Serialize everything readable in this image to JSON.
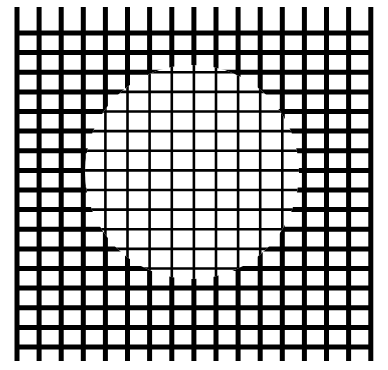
{
  "figure": {
    "kind": "illusory-contour-grid",
    "canvas": {
      "width": 388,
      "height": 370,
      "background_color": "#ffffff"
    },
    "grid": {
      "line_color": "#000000",
      "vertical_line_count": 17,
      "horizontal_line_count": 17,
      "x_start": 17,
      "y_start": 33,
      "cell_width": 22.1,
      "cell_height": 19.6,
      "outer_stroke_width": 5.0,
      "inner_stroke_width": 2.6,
      "x_extent_start": 17,
      "x_extent_end": 371,
      "y_extent_start": 7,
      "y_extent_end": 361
    },
    "circle": {
      "label": "thin-line-region",
      "center_x": 192,
      "center_y": 172,
      "radius": 107,
      "stroke_width": 2.6,
      "outline_visible": false
    }
  },
  "chart_data": {
    "type": "line",
    "title": "",
    "subtitle": "",
    "xlabel": "",
    "ylabel": "",
    "grid": true,
    "legend": "none",
    "annotations": [],
    "series": [
      {
        "name": "vertical-grid-lines",
        "orientation": "vertical",
        "stroke": "#000000",
        "x": [
          17,
          39.1,
          61.2,
          83.3,
          105.4,
          127.5,
          149.6,
          171.8,
          193.9,
          216.0,
          238.1,
          260.2,
          282.3,
          304.4,
          326.5,
          348.6,
          370.8
        ],
        "y_min": 7,
        "y_max": 361
      },
      {
        "name": "horizontal-grid-lines",
        "orientation": "horizontal",
        "stroke": "#000000",
        "y": [
          33,
          52.6,
          72.3,
          91.9,
          111.5,
          131.1,
          150.8,
          170.4,
          190.0,
          209.6,
          229.3,
          248.9,
          268.5,
          288.1,
          307.8,
          327.4,
          347.0
        ],
        "x_min": 17,
        "x_max": 371
      }
    ],
    "regions": [
      {
        "name": "outer-region",
        "stroke_width": 5.0,
        "description": "grid outside the circle drawn with thick strokes"
      },
      {
        "name": "inner-circle-region",
        "stroke_width": 2.6,
        "center": [
          192,
          172
        ],
        "radius": 107,
        "description": "grid inside the circle drawn with thin strokes"
      }
    ],
    "xlim": [
      0,
      388
    ],
    "ylim": [
      0,
      370
    ]
  }
}
